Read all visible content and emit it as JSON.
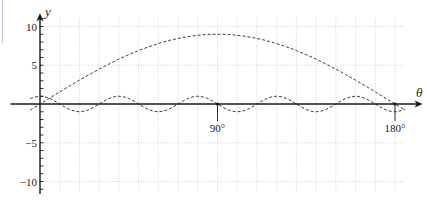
{
  "chart_data": {
    "type": "line",
    "title": "",
    "xlabel": "θ",
    "ylabel": "y",
    "xlim": [
      -15,
      194
    ],
    "ylim": [
      -11.6,
      11.7
    ],
    "legend": null,
    "grid": {
      "on": true,
      "x_lines": [
        0,
        10,
        20,
        30,
        40,
        50,
        60,
        70,
        80,
        90,
        100,
        110,
        120,
        130,
        140,
        150,
        160,
        170,
        180
      ],
      "y_lines": [
        -10,
        -5,
        5,
        10
      ],
      "x_range": [
        0,
        185
      ],
      "y_range": [
        -11.3,
        11.1
      ]
    },
    "y_ticks": {
      "minor": [
        -11,
        -10,
        -9,
        -8,
        -7,
        -6,
        -5,
        -4,
        -3,
        -2,
        -1,
        1,
        2,
        3,
        4,
        5,
        6,
        7,
        8,
        9,
        10,
        11
      ],
      "labels": [
        {
          "value": 10,
          "label": "10"
        },
        {
          "value": 5,
          "label": "5"
        },
        {
          "value": -5,
          "label": "−5"
        },
        {
          "value": -10,
          "label": "−10"
        }
      ]
    },
    "x_markers": [
      {
        "value": 90,
        "label": "90°"
      },
      {
        "value": 180,
        "label": "180°"
      }
    ],
    "x": [
      -5,
      0,
      5,
      10,
      15,
      20,
      25,
      30,
      35,
      40,
      45,
      50,
      55,
      60,
      65,
      70,
      75,
      80,
      85,
      90,
      95,
      100,
      105,
      110,
      115,
      120,
      125,
      130,
      135,
      140,
      145,
      150,
      155,
      160,
      165,
      170,
      175,
      180,
      185
    ],
    "series": [
      {
        "name": "dashed arch",
        "style": "dashed",
        "values": [
          -0.78,
          0,
          0.78,
          1.56,
          2.33,
          3.08,
          3.8,
          4.5,
          5.16,
          5.79,
          6.36,
          6.89,
          7.37,
          7.79,
          8.16,
          8.46,
          8.69,
          8.86,
          8.97,
          9,
          8.97,
          8.86,
          8.69,
          8.46,
          8.16,
          7.79,
          7.37,
          6.89,
          6.36,
          5.79,
          5.16,
          4.5,
          3.8,
          3.08,
          2.33,
          1.56,
          0.78,
          0,
          -0.78
        ]
      },
      {
        "name": "dashed oscillation",
        "style": "dashed",
        "values": [
          0.71,
          1,
          0.71,
          0,
          -0.71,
          -1,
          -0.71,
          0,
          0.71,
          1,
          0.71,
          0,
          -0.71,
          -1,
          -0.71,
          0,
          0.71,
          1,
          0.71,
          0,
          -0.71,
          -1,
          -0.71,
          0,
          0.71,
          1,
          0.71,
          0,
          -0.71,
          -1,
          -0.71,
          0,
          0.71,
          1,
          0.71,
          0,
          -0.71,
          -1,
          -0.71
        ]
      }
    ]
  }
}
